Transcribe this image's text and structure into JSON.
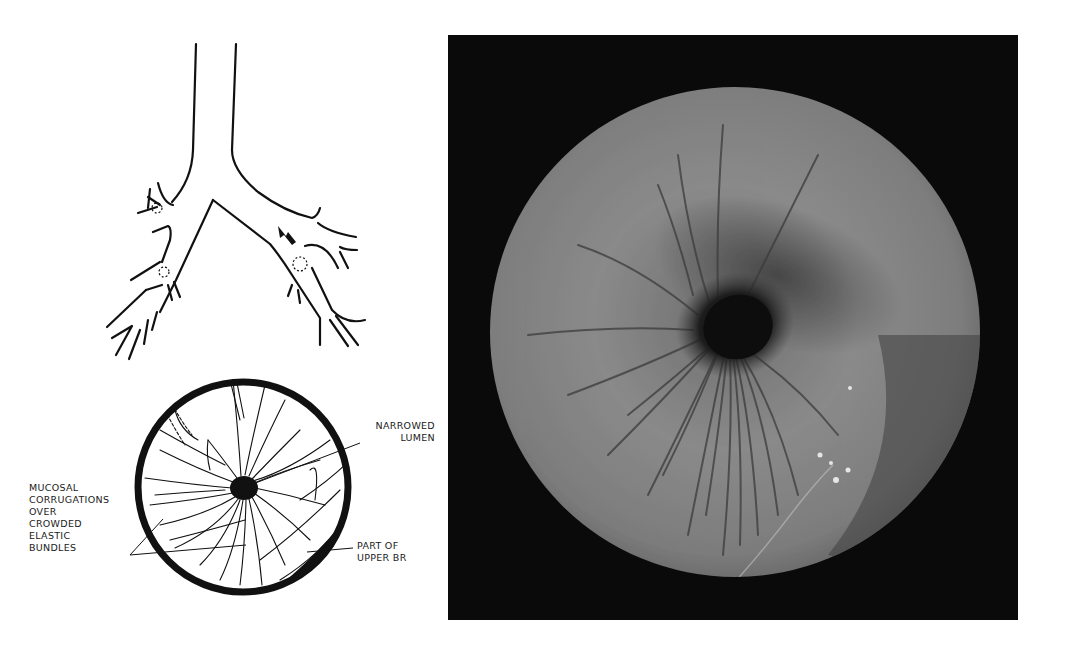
{
  "figure": {
    "bronchial_tree_diagram": {
      "arrow_icon": "arrow-down-right",
      "dotted_markers": 3
    },
    "endoscopic_schematic": {
      "labels": {
        "narrowed_lumen": "NARROWED\nLUMEN",
        "mucosal_corrugations": "MUCOSAL\nCORRUGATIONS\nOVER\nCROWDED\nELASTIC\nBUNDLES",
        "part_of_upper_br": "PART OF\nUPPER BR"
      }
    },
    "photograph": {
      "description": "Bronchoscopic view of narrowed lumen with radiating mucosal corrugations"
    },
    "colors": {
      "ink": "#111111",
      "background": "#ffffff",
      "photo_frame": "#0a0a0a",
      "mucosa_light": "#8e8e8e",
      "mucosa_dark": "#3c3c3c"
    }
  }
}
